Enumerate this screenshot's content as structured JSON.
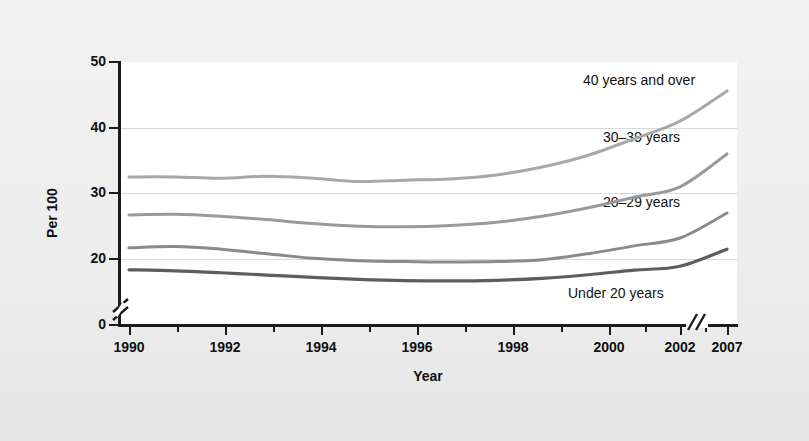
{
  "chart_data": {
    "type": "line",
    "title": "",
    "xlabel": "Year",
    "ylabel": "Per 100",
    "xlim": [
      1990,
      2007
    ],
    "ylim": [
      0,
      50
    ],
    "y_axis_break": true,
    "y_break_between": [
      0,
      18
    ],
    "x_axis_break": true,
    "x_break_between": [
      2002.6,
      2005.6
    ],
    "grid": "horizontal",
    "gridlines_at": [
      20,
      30,
      40
    ],
    "ytick_labels": [
      "0",
      "20",
      "30",
      "40",
      "50"
    ],
    "ytick_values": [
      0,
      20,
      30,
      40,
      50
    ],
    "xtick_labels": [
      "1990",
      "1992",
      "1994",
      "1996",
      "1998",
      "2000",
      "2002",
      "2007"
    ],
    "xtick_values": [
      1990,
      1992,
      1994,
      1996,
      1998,
      2000,
      2002,
      2007
    ],
    "legend_position": "inline-right",
    "x": [
      1990,
      1991,
      1992,
      1993,
      1994,
      1995,
      1996,
      1997,
      1998,
      1999,
      2000,
      2001,
      2002,
      2007
    ],
    "series": [
      {
        "name": "40 years and over",
        "color": "#a8a8a8",
        "label": "40 years and over",
        "values": [
          32.5,
          32.5,
          32.3,
          32.6,
          32.3,
          31.8,
          32.0,
          32.2,
          32.8,
          34.0,
          35.8,
          38.3,
          41.0,
          45.6
        ]
      },
      {
        "name": "30-39 years",
        "color": "#9a9a9a",
        "label": "30–39 years",
        "values": [
          26.7,
          26.8,
          26.5,
          26.0,
          25.4,
          25.0,
          24.9,
          25.1,
          25.6,
          26.5,
          27.8,
          29.4,
          31.0,
          36.0
        ]
      },
      {
        "name": "20-29 years",
        "color": "#8a8a8a",
        "label": "20–29 years",
        "values": [
          21.7,
          21.9,
          21.5,
          20.8,
          20.1,
          19.5,
          19.2,
          19.1,
          19.2,
          19.8,
          20.8,
          22.0,
          23.2,
          27.0
        ]
      },
      {
        "name": "Under 20 years",
        "color": "#5d5d5d",
        "label": "Under 20 years",
        "values": [
          16.7,
          16.4,
          15.8,
          15.1,
          14.4,
          13.8,
          13.4,
          13.3,
          13.5,
          14.1,
          15.2,
          16.6,
          17.8,
          21.5
        ]
      }
    ]
  },
  "labels": {
    "series_40_plus": "40 years and over",
    "series_30_39": "30–39 years",
    "series_20_29": "20–29 years",
    "series_under_20": "Under 20 years",
    "x_title": "Year",
    "y_title": "Per 100"
  },
  "ticks": {
    "y": [
      "50",
      "40",
      "30",
      "20",
      "0"
    ],
    "x": [
      "1990",
      "1992",
      "1994",
      "1996",
      "1998",
      "2000",
      "2002",
      "2007"
    ]
  },
  "colors": {
    "plot_background": "#ffffff",
    "figure_background": "#eeeeee",
    "axis": "#1b1b1b",
    "gridline": "#d9d9d9"
  }
}
